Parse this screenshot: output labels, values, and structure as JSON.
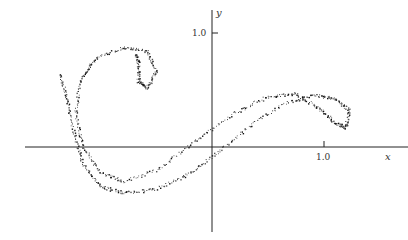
{
  "chart_data": {
    "type": "scatter",
    "title": "",
    "xlabel": "x",
    "ylabel": "y",
    "xlim": [
      -1.66,
      1.75
    ],
    "ylim": [
      -0.75,
      1.29
    ],
    "x_ticks": [
      {
        "value": 1.0,
        "label": "1.0"
      }
    ],
    "y_ticks": [
      {
        "value": 1.0,
        "label": "1.0"
      }
    ],
    "grid": false,
    "legend": null,
    "series": [
      {
        "name": "outer band",
        "points": [
          [
            -1.36,
            0.64
          ],
          [
            -1.3,
            0.44
          ],
          [
            -1.24,
            0.14
          ],
          [
            -1.16,
            -0.14
          ],
          [
            -1.0,
            -0.34
          ],
          [
            -0.8,
            -0.4
          ],
          [
            -0.52,
            -0.37
          ],
          [
            -0.22,
            -0.24
          ],
          [
            0.08,
            -0.02
          ],
          [
            0.36,
            0.21
          ],
          [
            0.66,
            0.39
          ],
          [
            0.92,
            0.46
          ],
          [
            1.1,
            0.42
          ],
          [
            1.22,
            0.33
          ],
          [
            1.19,
            0.17
          ],
          [
            1.09,
            0.22
          ],
          [
            0.96,
            0.34
          ],
          [
            0.74,
            0.47
          ],
          [
            0.48,
            0.44
          ],
          [
            0.18,
            0.29
          ],
          [
            -0.14,
            0.07
          ],
          [
            -0.46,
            -0.18
          ],
          [
            -0.78,
            -0.3
          ],
          [
            -1.0,
            -0.22
          ],
          [
            -1.16,
            0.02
          ],
          [
            -1.22,
            0.31
          ],
          [
            -1.18,
            0.59
          ],
          [
            -1.04,
            0.78
          ],
          [
            -0.78,
            0.88
          ],
          [
            -0.58,
            0.84
          ],
          [
            -0.5,
            0.68
          ],
          [
            -0.58,
            0.52
          ],
          [
            -0.66,
            0.58
          ],
          [
            -0.66,
            0.74
          ],
          [
            -0.68,
            0.82
          ]
        ]
      }
    ]
  },
  "axes": {
    "x_label": "x",
    "y_label": "y",
    "x_tick_label": "1.0",
    "y_tick_label": "1.0"
  }
}
